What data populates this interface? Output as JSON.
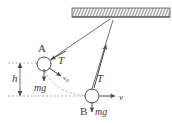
{
  "figure": {
    "type": "physics-free-body-diagram",
    "background_color": "#ffffff",
    "stroke_color": "#4a4a4a",
    "label_color": "#3a3a3a",
    "dash_color": "#9a9a9a",
    "width": 172,
    "height": 124
  },
  "ceiling": {
    "name": "hatched-ceiling",
    "x": 72,
    "y": 8,
    "width": 98,
    "height": 9,
    "hatch_count": 34
  },
  "pivot": {
    "name": "pivot-point",
    "x": 112,
    "y": 17
  },
  "bodies": [
    {
      "id": "A",
      "label": "A",
      "label_x": 41,
      "label_y": 51,
      "cx": 44,
      "cy": 64,
      "r": 7
    },
    {
      "id": "B",
      "label": "B",
      "label_x": 84,
      "label_y": 112,
      "cx": 92,
      "cy": 96,
      "r": 7
    }
  ],
  "vectors": [
    {
      "name": "tension-at-A",
      "label": "T",
      "label_x": 59,
      "label_y": 62,
      "from": [
        48,
        60
      ],
      "to": [
        108,
        20
      ]
    },
    {
      "name": "tension-at-B",
      "label": "T",
      "label_x": 97,
      "label_y": 80,
      "from": [
        92,
        89
      ],
      "to": [
        113,
        21
      ]
    },
    {
      "name": "weight-at-A",
      "label": "mg",
      "label_x": 38,
      "label_y": 89,
      "from": [
        44,
        71
      ],
      "to": [
        44,
        82
      ]
    },
    {
      "name": "weight-at-B",
      "label": "mg",
      "label_x": 96,
      "label_y": 112,
      "from": [
        92,
        103
      ],
      "to": [
        92,
        113
      ]
    },
    {
      "name": "initial-velocity-at-A",
      "label": "v",
      "sub": "0",
      "label_x": 66,
      "label_y": 79,
      "from": [
        49,
        69
      ],
      "to": [
        62,
        77
      ]
    },
    {
      "name": "velocity-at-B",
      "label": "v",
      "label_x": 121,
      "label_y": 100,
      "from": [
        101,
        96
      ],
      "to": [
        116,
        96
      ]
    }
  ],
  "dimension": {
    "name": "height-h",
    "label": "h",
    "label_x": 12,
    "label_y": 80,
    "x": 20,
    "y_top": 63,
    "y_bottom": 96,
    "top_dash_from": 8,
    "top_dash_to": 44,
    "bottom_dash_from": 8,
    "bottom_dash_to": 92
  },
  "trajectory": {
    "name": "swing-arc-path",
    "from": [
      45,
      71
    ],
    "to": [
      92,
      96
    ],
    "control": [
      56,
      95
    ]
  }
}
